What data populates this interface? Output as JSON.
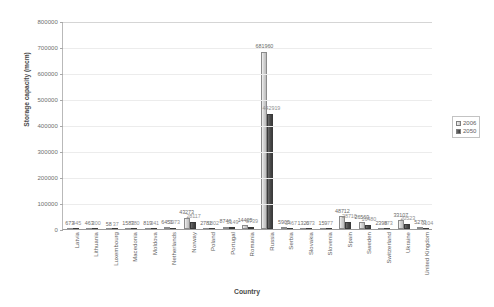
{
  "chart_data": {
    "type": "bar",
    "title": "",
    "xlabel": "Country",
    "ylabel": "Storage capacity (mcm)",
    "ylim": [
      0,
      800000
    ],
    "ytick_labels": [
      "800000",
      "700000",
      "600000",
      "500000",
      "400000",
      "300000",
      "200000",
      "100000",
      "0"
    ],
    "ytick_values": [
      800000,
      700000,
      600000,
      500000,
      400000,
      300000,
      200000,
      100000,
      0
    ],
    "grid": true,
    "legend_position": "right",
    "categories": [
      "Latvia",
      "Lithuania",
      "Luxembourg",
      "Macedonia",
      "Moldova",
      "Netherlands",
      "Norway",
      "Poland",
      "Portugal",
      "Romania",
      "Russia",
      "Serbia",
      "Slovakia",
      "Slovenia",
      "Spain",
      "Sweden",
      "Switzerland",
      "Ukraine",
      "United Kingdom"
    ],
    "series": [
      {
        "name": "2006",
        "values": [
          673,
          463,
          58,
          1583,
          819,
          6451,
          43273,
          2781,
          8746,
          14405,
          681960,
          5905,
          1320,
          159,
          48712,
          26569,
          2398,
          33107,
          5270
        ]
      },
      {
        "name": "2050",
        "values": [
          445,
          300,
          37,
          780,
          341,
          3973,
          28117,
          1802,
          5149,
          8739,
          442919,
          3467,
          673,
          77,
          28710,
          16480,
          973,
          20523,
          3104
        ]
      }
    ]
  }
}
